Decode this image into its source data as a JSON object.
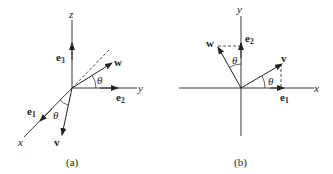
{
  "figure_a": {
    "caption": "(a)",
    "axes": {
      "x": "x",
      "y": "y",
      "z": "z"
    },
    "basis": {
      "e1": "e",
      "e1_sub": "1",
      "e2": "e",
      "e2_sub": "2",
      "e3": "e",
      "e3_sub": "3"
    },
    "vectors": {
      "v": "v",
      "w": "w"
    },
    "angle_labels": [
      "θ",
      "θ"
    ]
  },
  "figure_b": {
    "caption": "(b)",
    "axes": {
      "x": "x",
      "y": "y"
    },
    "basis": {
      "e1": "e",
      "e1_sub": "1",
      "e2": "e",
      "e2_sub": "2"
    },
    "vectors": {
      "v": "v",
      "w": "w"
    },
    "angle_labels": [
      "θ",
      "θ"
    ]
  },
  "colors": {
    "stroke": "#222222",
    "background": "#ffffff"
  }
}
